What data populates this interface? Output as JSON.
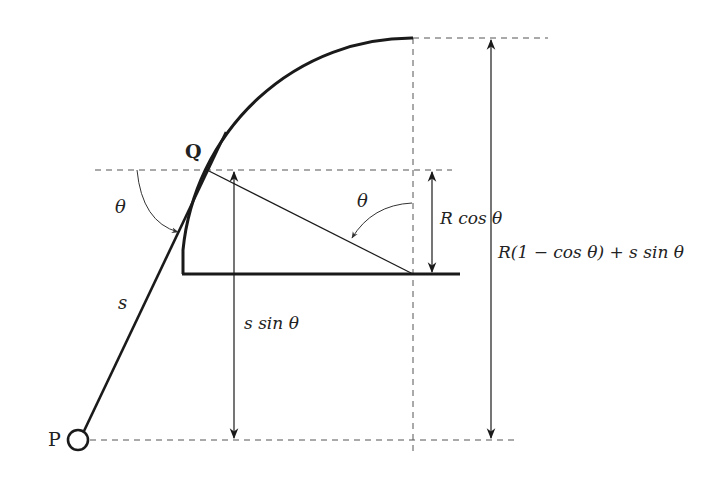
{
  "diagram": {
    "points": {
      "P": "P",
      "Q": "Q"
    },
    "labels": {
      "theta_left": "θ",
      "theta_right": "θ",
      "s": "s",
      "s_sin_theta": "s sin θ",
      "R_cos_theta": "R cos θ",
      "total_height": "R(1 − cos θ) + s sin θ"
    },
    "colors": {
      "stroke": "#1a1a1a",
      "dashed": "#555555",
      "background": "#ffffff"
    }
  }
}
